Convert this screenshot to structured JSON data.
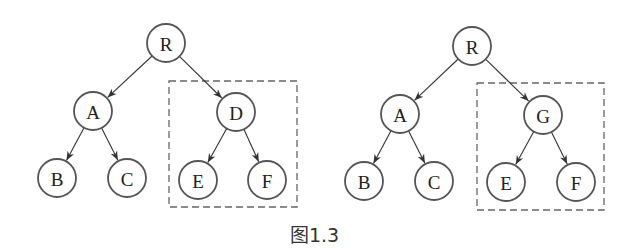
{
  "caption": "图1.3",
  "colors": {
    "node_stroke": "#555555",
    "edge": "#333333",
    "box": "#666666",
    "text": "#222222"
  },
  "node_radius": 19,
  "trees": [
    {
      "name": "left-tree",
      "nodes": [
        {
          "id": "R",
          "label": "R",
          "x": 166,
          "y": 43
        },
        {
          "id": "A",
          "label": "A",
          "x": 93,
          "y": 111
        },
        {
          "id": "D",
          "label": "D",
          "x": 236,
          "y": 112
        },
        {
          "id": "B",
          "label": "B",
          "x": 57,
          "y": 178
        },
        {
          "id": "C",
          "label": "C",
          "x": 127,
          "y": 178
        },
        {
          "id": "E",
          "label": "E",
          "x": 198,
          "y": 180
        },
        {
          "id": "F",
          "label": "F",
          "x": 267,
          "y": 180
        }
      ],
      "edges": [
        [
          "R",
          "A"
        ],
        [
          "R",
          "D"
        ],
        [
          "A",
          "B"
        ],
        [
          "A",
          "C"
        ],
        [
          "D",
          "E"
        ],
        [
          "D",
          "F"
        ]
      ],
      "dashed_box": {
        "x": 169,
        "y": 81,
        "width": 128,
        "height": 126,
        "encloses": [
          "D",
          "E",
          "F"
        ]
      }
    },
    {
      "name": "right-tree",
      "nodes": [
        {
          "id": "R",
          "label": "R",
          "x": 472,
          "y": 46
        },
        {
          "id": "A",
          "label": "A",
          "x": 400,
          "y": 114
        },
        {
          "id": "G",
          "label": "G",
          "x": 543,
          "y": 115
        },
        {
          "id": "B",
          "label": "B",
          "x": 364,
          "y": 181
        },
        {
          "id": "C",
          "label": "C",
          "x": 434,
          "y": 181
        },
        {
          "id": "E",
          "label": "E",
          "x": 506,
          "y": 182
        },
        {
          "id": "F",
          "label": "F",
          "x": 576,
          "y": 182
        }
      ],
      "edges": [
        [
          "R",
          "A"
        ],
        [
          "R",
          "G"
        ],
        [
          "A",
          "B"
        ],
        [
          "A",
          "C"
        ],
        [
          "G",
          "E"
        ],
        [
          "G",
          "F"
        ]
      ],
      "dashed_box": {
        "x": 477,
        "y": 83,
        "width": 127,
        "height": 127,
        "encloses": [
          "G",
          "E",
          "F"
        ]
      }
    }
  ]
}
